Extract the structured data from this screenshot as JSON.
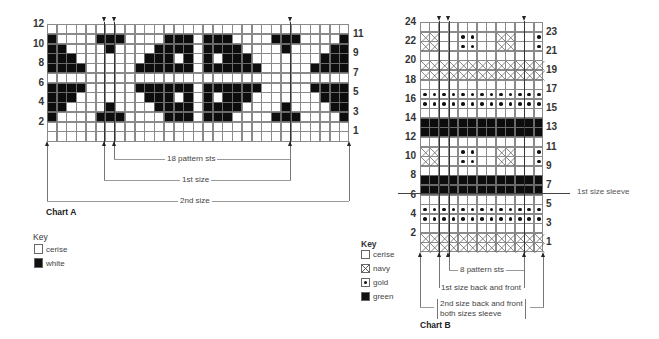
{
  "chartA": {
    "title": "Chart A",
    "rows": 12,
    "cols": 31,
    "left_row_labels": [
      "12",
      "10",
      "8",
      "6",
      "4",
      "2"
    ],
    "right_row_labels": [
      "11",
      "9",
      "7",
      "5",
      "3",
      "1"
    ],
    "black_cells": {
      "11": [
        0,
        5,
        6,
        7,
        12,
        13,
        14,
        16,
        17,
        18,
        23,
        24,
        25,
        30
      ],
      "10": [
        0,
        1,
        6,
        11,
        12,
        13,
        14,
        16,
        17,
        18,
        19,
        24,
        29,
        30
      ],
      "9": [
        0,
        1,
        2,
        10,
        11,
        12,
        14,
        16,
        18,
        19,
        20,
        28,
        29,
        30
      ],
      "8": [
        0,
        1,
        2,
        3,
        9,
        10,
        11,
        12,
        13,
        14,
        16,
        17,
        18,
        19,
        20,
        21,
        27,
        28,
        29,
        30
      ],
      "6": [
        0,
        1,
        2,
        3,
        9,
        10,
        11,
        12,
        13,
        14,
        16,
        17,
        18,
        19,
        20,
        21,
        27,
        28,
        29,
        30
      ],
      "5": [
        0,
        1,
        2,
        10,
        11,
        12,
        14,
        16,
        18,
        19,
        20,
        28,
        29,
        30
      ],
      "4": [
        0,
        1,
        6,
        11,
        12,
        13,
        14,
        16,
        17,
        18,
        19,
        24,
        29,
        30
      ],
      "3": [
        0,
        5,
        6,
        7,
        12,
        13,
        14,
        16,
        17,
        18,
        23,
        24,
        25,
        30
      ]
    },
    "annotations": {
      "pattern": "18 pattern sts",
      "first_size": "1st size",
      "second_size": "2nd size"
    },
    "key": {
      "title": "Key",
      "items": [
        {
          "label": "cerise",
          "symbol": "blank"
        },
        {
          "label": "white",
          "symbol": "black"
        }
      ]
    }
  },
  "chartB": {
    "title": "Chart B",
    "rows": 24,
    "cols": 13,
    "left_row_labels": [
      "24",
      "22",
      "20",
      "18",
      "16",
      "14",
      "12",
      "10",
      "8",
      "6",
      "4",
      "2"
    ],
    "right_row_labels": [
      "23",
      "21",
      "19",
      "17",
      "15",
      "13",
      "11",
      "9",
      "7",
      "5",
      "3",
      "1"
    ],
    "row_patterns": {
      "23": "motif",
      "22": "motif",
      "20": "navy",
      "19": "navy",
      "17": "gold",
      "16": "gold",
      "14": "green",
      "13": "green",
      "11": "motif",
      "10": "motif",
      "8": "green",
      "7": "green",
      "5": "gold",
      "4": "gold",
      "2": "navy",
      "1": "navy"
    },
    "motif": {
      "navy_cells": [
        0,
        1,
        8,
        9
      ],
      "gold_cells": [
        4,
        5,
        12
      ]
    },
    "separator_label": "1st size sleeve",
    "annotations": {
      "pattern": "8 pattern sts",
      "first_size": "1st size back and front",
      "second_size_line1": "2nd size back and front",
      "second_size_line2": "both sizes sleeve"
    },
    "key": {
      "title": "Key",
      "items": [
        {
          "label": "cerise",
          "symbol": "blank"
        },
        {
          "label": "navy",
          "symbol": "cross"
        },
        {
          "label": "gold",
          "symbol": "dot"
        },
        {
          "label": "green",
          "symbol": "black"
        }
      ]
    }
  }
}
